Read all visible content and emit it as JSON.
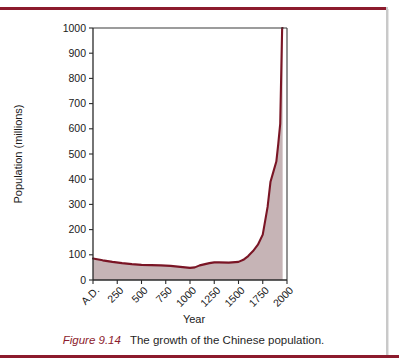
{
  "figure": {
    "label": "Figure 9.14",
    "text": "The growth of the Chinese population."
  },
  "colors": {
    "rule": "#8c1b2d",
    "curve_line": "#7a1525",
    "curve_fill": "#c6b4b6",
    "plot_border": "#3a3a3a",
    "caption_label": "#8c1b2d",
    "page_background": "#ffffff"
  },
  "chart_data": {
    "type": "area",
    "title": "",
    "xlabel": "Year",
    "ylabel": "Population (millions)",
    "xlim": [
      0,
      2000
    ],
    "ylim": [
      0,
      1000
    ],
    "grid": false,
    "legend": "none",
    "xtick_labels": [
      "A.D.",
      "250",
      "500",
      "750",
      "1000",
      "1250",
      "1500",
      "1750",
      "2000"
    ],
    "xtick_values": [
      0,
      250,
      500,
      750,
      1000,
      1250,
      1500,
      1750,
      2000
    ],
    "ytick_labels": [
      "0",
      "100",
      "200",
      "300",
      "400",
      "500",
      "600",
      "700",
      "800",
      "900",
      "1000"
    ],
    "ytick_values": [
      0,
      100,
      200,
      300,
      400,
      500,
      600,
      700,
      800,
      900,
      1000
    ],
    "x": [
      0,
      100,
      200,
      300,
      400,
      500,
      600,
      700,
      800,
      900,
      1000,
      1050,
      1100,
      1200,
      1250,
      1300,
      1400,
      1500,
      1550,
      1600,
      1650,
      1700,
      1750,
      1800,
      1830,
      1860,
      1890,
      1910,
      1930,
      1950,
      1955
    ],
    "values": [
      85,
      78,
      72,
      67,
      63,
      60,
      59,
      58,
      56,
      52,
      48,
      50,
      58,
      67,
      70,
      70,
      69,
      72,
      80,
      95,
      115,
      140,
      180,
      290,
      390,
      430,
      470,
      540,
      620,
      1000,
      1000
    ],
    "series": [
      {
        "name": "Chinese population",
        "values": [
          85,
          78,
          72,
          67,
          63,
          60,
          59,
          58,
          56,
          52,
          48,
          50,
          58,
          67,
          70,
          70,
          69,
          72,
          80,
          95,
          115,
          140,
          180,
          290,
          390,
          430,
          470,
          540,
          620,
          1000,
          1000
        ]
      }
    ]
  }
}
